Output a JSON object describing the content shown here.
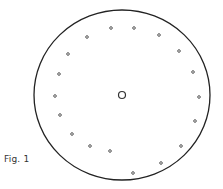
{
  "figure": {
    "caption": "Fig. 1",
    "outer_circle": {
      "cx": 122,
      "cy": 95,
      "rx": 88,
      "ry": 85,
      "stroke": "#222222"
    },
    "center_hole": {
      "cx": 122,
      "cy": 95,
      "r": 3.5
    },
    "dots": [
      [
        111,
        28
      ],
      [
        134,
        28
      ],
      [
        159,
        35
      ],
      [
        87,
        37
      ],
      [
        179,
        51
      ],
      [
        68,
        54
      ],
      [
        193,
        72
      ],
      [
        59,
        74
      ],
      [
        199,
        97
      ],
      [
        55,
        96
      ],
      [
        60,
        115
      ],
      [
        195,
        121
      ],
      [
        72,
        134
      ],
      [
        181,
        146
      ],
      [
        90,
        146
      ],
      [
        110,
        151
      ],
      [
        161,
        163
      ],
      [
        133,
        173
      ]
    ]
  }
}
